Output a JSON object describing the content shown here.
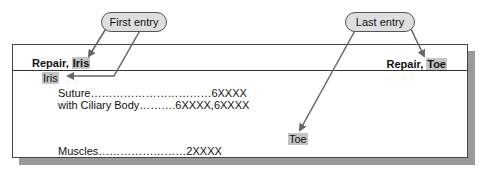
{
  "callouts": {
    "first": "First entry",
    "last": "Last entry"
  },
  "header": {
    "left_prefix": "Repair, ",
    "left_term": "Iris",
    "right_prefix": "Repair, ",
    "right_term": "Toe"
  },
  "entries": {
    "subterm": "Iris",
    "suture": "Suture……………………………6XXXX",
    "ciliary": "with Ciliary Body……….6XXXX,6XXXX",
    "toe": "Toe",
    "muscles": "Muscles……………………2XXXX"
  },
  "colors": {
    "highlight": "#c4c4c4",
    "callout_fill": "#dedede",
    "arrow": "#666666",
    "shadow": "#9a9a9a"
  }
}
